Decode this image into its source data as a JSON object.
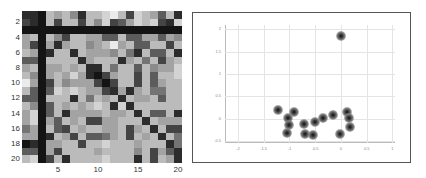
{
  "chart_data": [
    {
      "type": "heatmap",
      "title": "",
      "xlabel": "",
      "ylabel": "",
      "x_ticks": [
        "5",
        "10",
        "15",
        "20"
      ],
      "y_ticks": [
        "2",
        "4",
        "6",
        "8",
        "10",
        "12",
        "14",
        "16",
        "18",
        "20"
      ],
      "rows": 20,
      "cols": 20,
      "colormap": "gray",
      "values": [
        [
          1,
          1,
          0,
          7,
          6,
          7,
          5,
          1,
          7,
          7,
          8,
          9,
          7,
          2,
          8,
          7,
          6,
          3,
          7,
          1
        ],
        [
          2,
          1,
          0,
          7,
          2,
          7,
          7,
          2,
          7,
          5,
          8,
          2,
          3,
          6,
          8,
          7,
          8,
          2,
          1,
          8
        ],
        [
          0,
          0,
          0,
          0,
          0,
          0,
          0,
          0,
          0,
          0,
          0,
          0,
          0,
          0,
          0,
          0,
          0,
          0,
          0,
          0
        ],
        [
          6,
          7,
          0,
          7,
          5,
          2,
          7,
          7,
          6,
          6,
          3,
          3,
          7,
          3,
          3,
          6,
          6,
          3,
          6,
          5
        ],
        [
          6,
          2,
          0,
          6,
          1,
          6,
          7,
          7,
          5,
          6,
          7,
          9,
          6,
          7,
          3,
          3,
          7,
          7,
          2,
          7
        ],
        [
          7,
          6,
          0,
          1,
          7,
          7,
          1,
          7,
          6,
          6,
          6,
          5,
          7,
          4,
          1,
          7,
          3,
          3,
          7,
          1
        ],
        [
          3,
          3,
          0,
          7,
          7,
          7,
          7,
          1,
          6,
          7,
          7,
          7,
          1,
          6,
          7,
          4,
          7,
          2,
          6,
          7
        ],
        [
          6,
          7,
          0,
          6,
          6,
          7,
          6,
          7,
          1,
          1,
          7,
          4,
          7,
          7,
          3,
          7,
          5,
          6,
          6,
          8
        ],
        [
          7,
          5,
          0,
          6,
          7,
          6,
          8,
          6,
          1,
          0,
          2,
          6,
          7,
          7,
          2,
          7,
          3,
          7,
          7,
          8
        ],
        [
          9,
          6,
          0,
          2,
          7,
          5,
          6,
          6,
          6,
          2,
          0,
          2,
          7,
          7,
          2,
          7,
          3,
          6,
          7,
          7
        ],
        [
          7,
          3,
          0,
          3,
          8,
          7,
          8,
          7,
          6,
          6,
          2,
          1,
          6,
          1,
          6,
          7,
          4,
          4,
          7,
          7
        ],
        [
          3,
          3,
          0,
          7,
          7,
          7,
          1,
          7,
          4,
          7,
          6,
          7,
          1,
          7,
          6,
          6,
          7,
          3,
          7,
          7
        ],
        [
          7,
          5,
          0,
          3,
          7,
          6,
          7,
          6,
          7,
          8,
          7,
          1,
          8,
          1,
          7,
          7,
          7,
          7,
          7,
          7
        ],
        [
          6,
          8,
          0,
          3,
          7,
          1,
          6,
          6,
          6,
          6,
          7,
          6,
          6,
          7,
          1,
          7,
          3,
          3,
          7,
          1
        ],
        [
          6,
          8,
          0,
          6,
          3,
          7,
          6,
          7,
          2,
          2,
          6,
          6,
          7,
          7,
          7,
          1,
          7,
          6,
          6,
          6
        ],
        [
          4,
          6,
          0,
          7,
          3,
          2,
          7,
          6,
          7,
          7,
          6,
          6,
          7,
          2,
          6,
          7,
          1,
          7,
          2,
          2
        ],
        [
          6,
          6,
          0,
          1,
          7,
          6,
          2,
          7,
          3,
          3,
          4,
          6,
          7,
          2,
          7,
          6,
          7,
          1,
          7,
          4
        ],
        [
          0,
          1,
          0,
          6,
          6,
          7,
          7,
          2,
          7,
          7,
          8,
          7,
          7,
          7,
          6,
          7,
          7,
          7,
          1,
          4
        ],
        [
          3,
          3,
          0,
          6,
          2,
          7,
          7,
          7,
          7,
          6,
          7,
          7,
          7,
          7,
          5,
          7,
          2,
          6,
          3,
          1
        ],
        [
          7,
          8,
          0,
          2,
          7,
          1,
          7,
          7,
          7,
          7,
          8,
          7,
          7,
          7,
          1,
          7,
          2,
          7,
          6,
          1
        ]
      ]
    },
    {
      "type": "scatter",
      "title": "",
      "xlabel": "",
      "ylabel": "",
      "xlim": [
        -2.25,
        1.05
      ],
      "ylim": [
        -0.55,
        2.1
      ],
      "x_ticks": [
        "-2",
        "-1.5",
        "-1",
        "-0.5",
        "0",
        "0.5",
        "1"
      ],
      "y_ticks": [
        "2",
        "1.5",
        "1",
        "0.5",
        "0",
        "-0.5"
      ],
      "grid": true,
      "points": [
        {
          "x": 0.0,
          "y": 1.85
        },
        {
          "x": -1.22,
          "y": 0.18
        },
        {
          "x": -0.92,
          "y": 0.14
        },
        {
          "x": -1.02,
          "y": 0.02
        },
        {
          "x": -0.72,
          "y": -0.12
        },
        {
          "x": -1.0,
          "y": -0.15
        },
        {
          "x": -0.5,
          "y": -0.08
        },
        {
          "x": -0.35,
          "y": 0.02
        },
        {
          "x": -0.15,
          "y": 0.08
        },
        {
          "x": 0.12,
          "y": 0.14
        },
        {
          "x": 0.15,
          "y": 0.02
        },
        {
          "x": 0.18,
          "y": -0.2
        },
        {
          "x": -1.05,
          "y": -0.33
        },
        {
          "x": -0.7,
          "y": -0.35
        },
        {
          "x": -0.55,
          "y": -0.38
        },
        {
          "x": -0.02,
          "y": -0.35
        }
      ]
    }
  ]
}
